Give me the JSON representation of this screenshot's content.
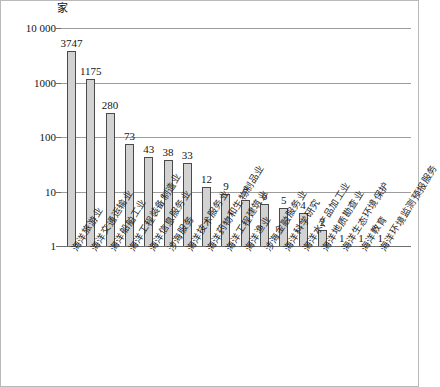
{
  "figure": {
    "unit_label": "家",
    "border_color": "#b9b9b9",
    "bar_fill": "#d2d2d2",
    "bar_stroke": "#4a4a4a",
    "grid_color": "#9c9c9c"
  },
  "chart_data": {
    "type": "bar",
    "title": "",
    "subtitle": "",
    "xlabel": "",
    "ylabel": "家",
    "yscale": "log",
    "ylim": [
      1,
      10000
    ],
    "ytick_labels": [
      "1",
      "10",
      "100",
      "1000",
      "10 000"
    ],
    "ytick_values": [
      1,
      10,
      100,
      1000,
      10000
    ],
    "grid": true,
    "legend": "none",
    "categories": [
      "海洋旅游业",
      "海洋交通运输业",
      "海洋船舶工业",
      "海洋工程装备制造业",
      "海洋信息服务业",
      "涉海服务",
      "海洋技术服务业",
      "海洋药物和生物制品业",
      "海洋工程建筑业",
      "海洋渔业",
      "涉海金融服务业",
      "海洋科学研究",
      "海洋水产品加工业",
      "海洋地质勘查业",
      "海洋生态环境保护",
      "海洋教育",
      "海洋环境监测预报服务"
    ],
    "values": [
      3747,
      1175,
      280,
      73,
      43,
      38,
      33,
      12,
      9,
      7,
      6,
      5,
      4,
      2,
      1,
      1,
      1
    ],
    "value_labels": [
      "3747",
      "1175",
      "280",
      "73",
      "43",
      "38",
      "33",
      "12",
      "9",
      "7",
      "6",
      "5",
      "4",
      "2",
      "1",
      "1",
      "1"
    ]
  }
}
